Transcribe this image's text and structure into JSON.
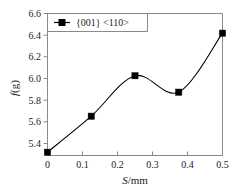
{
  "chart_data": {
    "type": "line",
    "title": "",
    "subtitle": "",
    "xlabel": "S/mm",
    "ylabel": "f(g)",
    "xlim": [
      0,
      0.5
    ],
    "ylim": [
      5.3,
      6.6
    ],
    "grid": false,
    "legend_position": "top-left",
    "x_ticks": [
      "0",
      "0.1",
      "0.2",
      "0.3",
      "0.4",
      "0.5"
    ],
    "x_tick_values": [
      0,
      0.1,
      0.2,
      0.3,
      0.4,
      0.5
    ],
    "y_ticks": [
      "5.4",
      "5.6",
      "5.8",
      "6.0",
      "6.2",
      "6.4",
      "6.6"
    ],
    "y_tick_values": [
      5.4,
      5.6,
      5.8,
      6.0,
      6.2,
      6.4,
      6.6
    ],
    "series": [
      {
        "name": "{001} <110>",
        "marker": "filled-square",
        "color": "#000000",
        "x": [
          0,
          0.125,
          0.25,
          0.375,
          0.5
        ],
        "values": [
          5.33,
          5.66,
          6.03,
          5.88,
          6.42
        ]
      }
    ]
  },
  "axes": {
    "x_axis_label": "S/mm",
    "x_axis_label_italic": "S",
    "x_axis_label_rest": "/mm",
    "y_axis_label": "f(g)",
    "y_axis_label_italic": "f",
    "y_axis_label_rest": "(g)"
  },
  "legend": {
    "entries": [
      {
        "label": "{001} <110>",
        "marker_icon": "filled-square-with-line-icon"
      }
    ]
  }
}
